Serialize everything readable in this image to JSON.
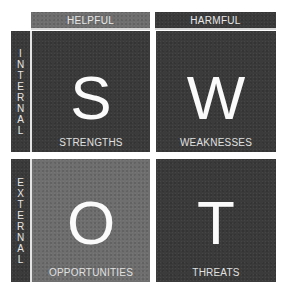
{
  "swot": {
    "columns": [
      {
        "label": "HELPFUL",
        "color": "#707070"
      },
      {
        "label": "HARMFUL",
        "color": "#3c3c3c"
      }
    ],
    "rows": [
      {
        "label": "INTERNAL",
        "letters": [
          "I",
          "N",
          "T",
          "E",
          "R",
          "N",
          "A",
          "L"
        ],
        "color": "#3b3b3b"
      },
      {
        "label": "EXTERNAL",
        "letters": [
          "E",
          "X",
          "T",
          "E",
          "R",
          "N",
          "A",
          "L"
        ],
        "color": "#3b3b3b"
      }
    ],
    "quadrants": [
      {
        "letter": "S",
        "label": "STRENGTHS",
        "color": "#3b3b3b"
      },
      {
        "letter": "W",
        "label": "WEAKNESSES",
        "color": "#3b3b3b"
      },
      {
        "letter": "O",
        "label": "OPPORTUNITIES",
        "color": "#6f6f6f"
      },
      {
        "letter": "T",
        "label": "THREATS",
        "color": "#3b3b3b"
      }
    ]
  }
}
